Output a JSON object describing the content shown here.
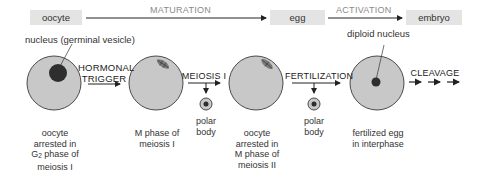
{
  "stages": {
    "oocyte": "oocyte",
    "egg": "egg",
    "embryo": "embryo"
  },
  "processes": {
    "maturation": "MATURATION",
    "activation": "ACTIVATION"
  },
  "annotations": {
    "nucleus": "nucleus (germinal vesicle)",
    "diploid_nucleus": "diploid nucleus"
  },
  "transitions": {
    "hormonal_trigger_line1": "HORMONAL",
    "hormonal_trigger_line2": "TRIGGER",
    "meiosis_i": "MEIOSIS I",
    "fertilization": "FERTILIZATION",
    "cleavage": "CLEAVAGE"
  },
  "polar_bodies": [
    {
      "line1": "polar",
      "line2": "body"
    },
    {
      "line1": "polar",
      "line2": "body"
    }
  ],
  "cells": [
    {
      "lines": [
        "oocyte",
        "arrested in",
        "G",
        "phase of",
        "meiosis I"
      ],
      "g_sub": "2"
    },
    {
      "lines": [
        "M phase of",
        "meiosis I"
      ]
    },
    {
      "lines": [
        "oocyte",
        "arrested in",
        "M phase of",
        "meiosis II"
      ]
    },
    {
      "lines": [
        "fertilized egg",
        "in interphase"
      ]
    }
  ],
  "colors": {
    "cell_fill": "#c8c8c8",
    "cell_stroke": "#3a3a3a",
    "nucleus_fill": "#2e2e2e",
    "stage_box": "#e4e4e4",
    "process_text": "#8a8a8a"
  }
}
